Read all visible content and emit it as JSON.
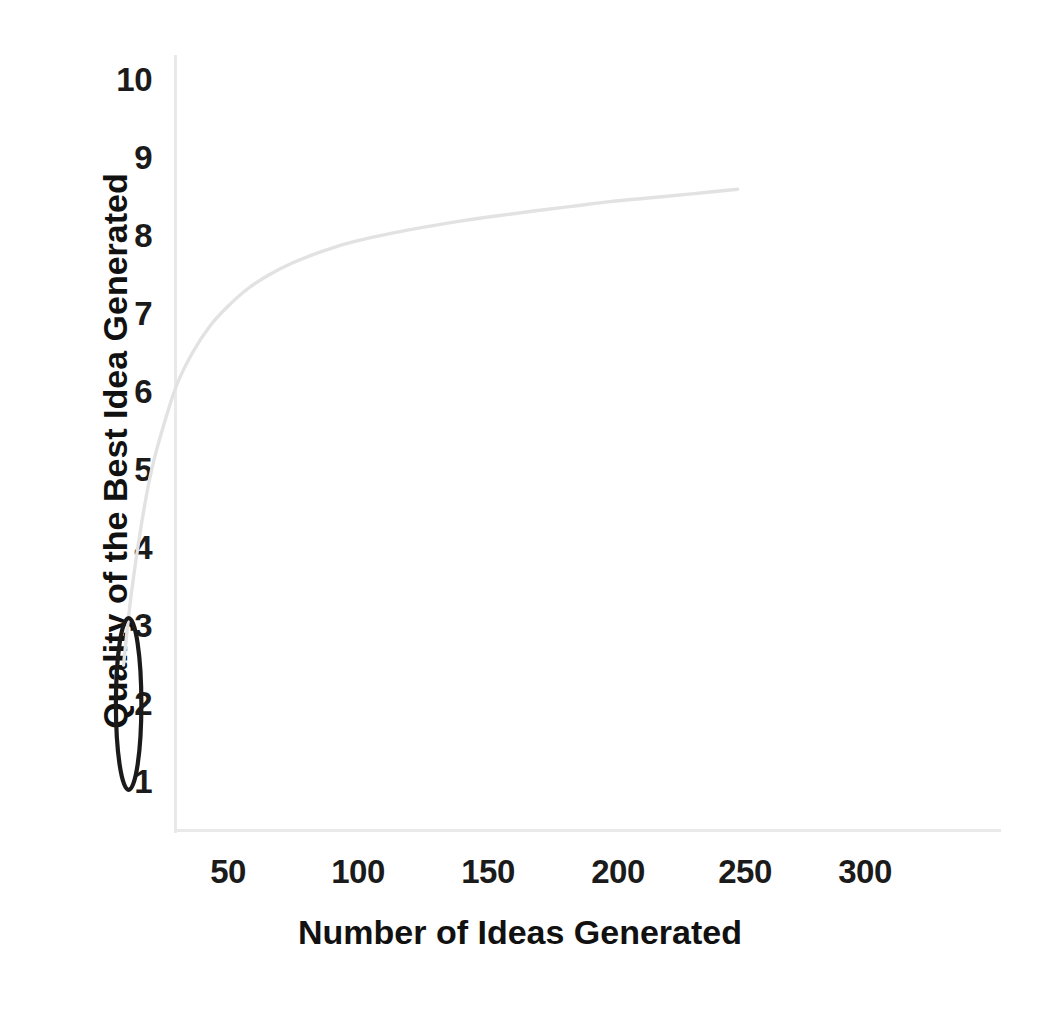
{
  "chart_data": {
    "type": "line",
    "title": "",
    "subtitle": "",
    "xlabel": "Number of Ideas Generated",
    "ylabel": "Quality of the Best Idea Generated",
    "xlim": [
      0,
      330
    ],
    "ylim": [
      0.5,
      10.4
    ],
    "xticks": [
      50,
      100,
      150,
      200,
      250,
      300
    ],
    "xtick_labels": [
      "50",
      "100",
      "150",
      "200",
      "250",
      "300"
    ],
    "yticks": [
      1,
      2,
      3,
      4,
      5,
      6,
      7,
      8,
      9,
      10
    ],
    "ytick_labels": [
      "10",
      "9",
      "8",
      "7",
      "6",
      "5",
      "4",
      "3",
      "2",
      "1"
    ],
    "grid": false,
    "legend": null,
    "series": [
      {
        "name": "Quality of best idea",
        "color": "#e2e2e2",
        "x": [
          9,
          12,
          16,
          20,
          25,
          30,
          36,
          43,
          50,
          58,
          66,
          75,
          85,
          95,
          106,
          118,
          130,
          143,
          156,
          170,
          185,
          200,
          216,
          232,
          250
        ],
        "values": [
          2.5,
          3.4,
          4.3,
          5.0,
          5.6,
          6.1,
          6.5,
          6.85,
          7.1,
          7.33,
          7.5,
          7.65,
          7.78,
          7.89,
          7.98,
          8.06,
          8.13,
          8.2,
          8.26,
          8.32,
          8.38,
          8.44,
          8.49,
          8.54,
          8.6
        ]
      }
    ],
    "annotations": [
      {
        "name": "early-ideas-ellipse",
        "shape": "ellipse",
        "color": "#1a1a1a",
        "x_center": 11,
        "y_center": 2.0,
        "x_radius": 5,
        "y_radius": 1.1,
        "label": ""
      }
    ]
  },
  "axes": {
    "line_color": "#e9e9e9",
    "text_color": "#1b1b1b",
    "background": "#ffffff"
  }
}
